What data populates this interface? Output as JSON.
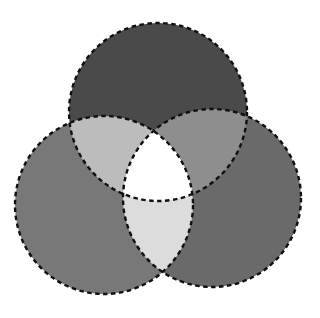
{
  "figure": {
    "width": 320,
    "height": 318,
    "background_color": "#ffffff"
  },
  "style": {
    "stroke_color": "#101010",
    "stroke_width": 2.4,
    "dash_pattern": "4.5 3.5",
    "dash_linecap": "butt"
  },
  "chart_data": {
    "type": "venn",
    "set_count": 3,
    "sets": [
      {
        "id": "top",
        "name": "A",
        "label": "",
        "cx": 158,
        "cy": 112,
        "r": 89,
        "fill": "#4a4a4a"
      },
      {
        "id": "left",
        "name": "B",
        "label": "",
        "cx": 104,
        "cy": 205,
        "r": 89,
        "fill": "#787878"
      },
      {
        "id": "right",
        "name": "C",
        "label": "",
        "cx": 212,
        "cy": 198,
        "r": 89,
        "fill": "#6a6a6a"
      }
    ],
    "regions": [
      {
        "id": "top-only",
        "members": [
          "top"
        ],
        "fill": "#4a4a4a"
      },
      {
        "id": "left-only",
        "members": [
          "left"
        ],
        "fill": "#787878"
      },
      {
        "id": "right-only",
        "members": [
          "right"
        ],
        "fill": "#6a6a6a"
      },
      {
        "id": "top-left-overlap",
        "members": [
          "top",
          "left"
        ],
        "fill": "#bcbcbc"
      },
      {
        "id": "top-right-overlap",
        "members": [
          "top",
          "right"
        ],
        "fill": "#8e8e8e"
      },
      {
        "id": "left-right-overlap",
        "members": [
          "left",
          "right"
        ],
        "fill": "#dcdcdc"
      },
      {
        "id": "center-overlap",
        "members": [
          "top",
          "left",
          "right"
        ],
        "fill": "#ffffff"
      }
    ],
    "legend": "none",
    "grid": false,
    "axis": "none"
  }
}
